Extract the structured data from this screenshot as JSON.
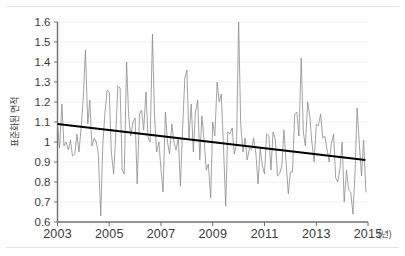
{
  "chart_data": {
    "type": "line",
    "title": "",
    "subtitle": "",
    "xlabel": "",
    "xlabel_unit": "(년)",
    "ylabel": "표준화된 면적",
    "xlim": [
      2003.0,
      2015.0
    ],
    "ylim": [
      0.6,
      1.6
    ],
    "grid": true,
    "grid_axis": "y",
    "legend": "none",
    "legend_position": "none",
    "ytick_labels": [
      "0.6",
      "0.7",
      "0.8",
      "0.9",
      "1",
      "1.1",
      "1.2",
      "1.3",
      "1.4",
      "1.5",
      "1.6"
    ],
    "ytick_values": [
      0.6,
      0.7,
      0.8,
      0.9,
      1.0,
      1.1,
      1.2,
      1.3,
      1.4,
      1.5,
      1.6
    ],
    "xtick_labels": [
      "2003",
      "2005",
      "2007",
      "2009",
      "2011",
      "2013",
      "2015"
    ],
    "xtick_values": [
      2003,
      2005,
      2007,
      2009,
      2011,
      2013,
      2015
    ],
    "series": [
      {
        "name": "표준화된 면적",
        "type": "line",
        "color": "#8c8c8c",
        "line_width": 0.8,
        "x": [
          2003.0,
          2003.08,
          2003.17,
          2003.25,
          2003.33,
          2003.42,
          2003.5,
          2003.58,
          2003.67,
          2003.75,
          2003.83,
          2003.92,
          2004.0,
          2004.08,
          2004.17,
          2004.25,
          2004.33,
          2004.42,
          2004.5,
          2004.58,
          2004.67,
          2004.75,
          2004.83,
          2004.92,
          2005.0,
          2005.08,
          2005.17,
          2005.25,
          2005.33,
          2005.42,
          2005.5,
          2005.58,
          2005.67,
          2005.75,
          2005.83,
          2005.92,
          2006.0,
          2006.08,
          2006.17,
          2006.25,
          2006.33,
          2006.42,
          2006.5,
          2006.58,
          2006.67,
          2006.75,
          2006.83,
          2006.92,
          2007.0,
          2007.08,
          2007.17,
          2007.25,
          2007.33,
          2007.42,
          2007.5,
          2007.58,
          2007.67,
          2007.75,
          2007.83,
          2007.92,
          2008.0,
          2008.08,
          2008.17,
          2008.25,
          2008.33,
          2008.42,
          2008.5,
          2008.58,
          2008.67,
          2008.75,
          2008.83,
          2008.92,
          2009.0,
          2009.08,
          2009.17,
          2009.25,
          2009.33,
          2009.42,
          2009.5,
          2009.58,
          2009.67,
          2009.75,
          2009.83,
          2009.92,
          2010.0,
          2010.08,
          2010.17,
          2010.25,
          2010.33,
          2010.42,
          2010.5,
          2010.58,
          2010.67,
          2010.75,
          2010.83,
          2010.92,
          2011.0,
          2011.08,
          2011.17,
          2011.25,
          2011.33,
          2011.42,
          2011.5,
          2011.58,
          2011.67,
          2011.75,
          2011.83,
          2011.92,
          2012.0,
          2012.08,
          2012.17,
          2012.25,
          2012.33,
          2012.42,
          2012.5,
          2012.58,
          2012.67,
          2012.75,
          2012.83,
          2012.92,
          2013.0,
          2013.08,
          2013.17,
          2013.25,
          2013.33,
          2013.42,
          2013.5,
          2013.58,
          2013.67,
          2013.75,
          2013.83,
          2013.92,
          2014.0,
          2014.08,
          2014.17,
          2014.25,
          2014.33,
          2014.42,
          2014.5,
          2014.58,
          2014.67,
          2014.75,
          2014.83,
          2014.92
        ],
        "values": [
          1.09,
          0.97,
          1.19,
          0.98,
          1.0,
          0.96,
          1.01,
          0.93,
          0.94,
          1.04,
          0.95,
          1.08,
          1.23,
          1.46,
          1.09,
          1.21,
          0.98,
          1.02,
          1.0,
          0.94,
          0.63,
          0.98,
          1.14,
          1.26,
          1.25,
          0.95,
          0.84,
          1.03,
          1.28,
          1.27,
          0.86,
          0.84,
          1.4,
          1.13,
          1.03,
          1.1,
          1.12,
          0.79,
          1.14,
          1.16,
          1.06,
          1.25,
          1.02,
          1.0,
          1.54,
          1.13,
          0.95,
          1.0,
          0.86,
          0.75,
          1.15,
          1.0,
          0.94,
          1.09,
          1.0,
          0.96,
          1.02,
          0.78,
          1.05,
          1.32,
          1.36,
          1.02,
          1.19,
          0.95,
          1.15,
          1.21,
          0.91,
          1.13,
          1.0,
          0.86,
          0.89,
          0.72,
          1.1,
          1.03,
          1.3,
          1.2,
          1.24,
          0.96,
          0.68,
          1.05,
          1.04,
          1.07,
          0.94,
          0.99,
          1.6,
          1.09,
          0.95,
          1.02,
          0.91,
          0.97,
          0.96,
          1.02,
          0.94,
          0.79,
          0.97,
          0.88,
          0.84,
          1.04,
          1.03,
          0.86,
          1.05,
          1.01,
          0.83,
          0.84,
          0.88,
          1.06,
          0.91,
          0.74,
          0.85,
          0.85,
          1.14,
          1.15,
          1.03,
          1.42,
          1.05,
          0.98,
          1.2,
          1.13,
          1.0,
          0.9,
          1.09,
          1.08,
          1.14,
          1.02,
          1.03,
          0.96,
          0.9,
          0.99,
          1.04,
          0.82,
          0.8,
          0.87,
          1.0,
          0.7,
          0.86,
          0.76,
          0.75,
          0.64,
          0.85,
          1.17,
          0.98,
          0.83,
          1.01,
          0.75
        ]
      },
      {
        "name": "추세선",
        "type": "trendline",
        "color": "#000000",
        "line_width": 2.2,
        "x": [
          2003.0,
          2014.9
        ],
        "values": [
          1.09,
          0.91
        ]
      }
    ]
  },
  "axes": {
    "y_axis_line_color": "#6f6f6f",
    "x_axis_line_color": "#6f6f6f",
    "grid_color": "#f0f0f0",
    "tick_color": "#6f6f6f"
  }
}
